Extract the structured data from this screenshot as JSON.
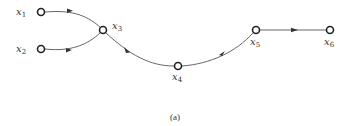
{
  "diagram": {
    "type": "signal-flow-graph",
    "caption": "(a)",
    "nodes": [
      {
        "id": "x1",
        "label": "x",
        "sub": "1",
        "cx": 41,
        "cy": 12
      },
      {
        "id": "x2",
        "label": "x",
        "sub": "2",
        "cx": 41,
        "cy": 49
      },
      {
        "id": "x3",
        "label": "x",
        "sub": "3",
        "cx": 103,
        "cy": 30
      },
      {
        "id": "x4",
        "label": "x",
        "sub": "4",
        "cx": 178,
        "cy": 66
      },
      {
        "id": "x5",
        "label": "x",
        "sub": "5",
        "cx": 256,
        "cy": 30
      },
      {
        "id": "x6",
        "label": "x",
        "sub": "6",
        "cx": 330,
        "cy": 30
      }
    ],
    "edges": [
      {
        "from": "x1",
        "to": "x3"
      },
      {
        "from": "x2",
        "to": "x3"
      },
      {
        "from": "x3",
        "to": "x4"
      },
      {
        "from": "x4",
        "to": "x5"
      },
      {
        "from": "x5",
        "to": "x6"
      }
    ],
    "colors": {
      "stroke": "#444444",
      "node_fill": "#ffffff"
    }
  }
}
